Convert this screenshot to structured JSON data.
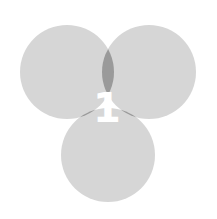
{
  "diagram": {
    "type": "venn",
    "circles": [
      {
        "name": "left",
        "cx": 67,
        "cy": 72,
        "r": 47
      },
      {
        "name": "right",
        "cx": 149,
        "cy": 72,
        "r": 47
      },
      {
        "name": "bottom",
        "cx": 108,
        "cy": 155,
        "r": 47
      }
    ],
    "center_label": "1",
    "colors": {
      "single": "#d6d6d6",
      "double": "#9a9a9a",
      "triple": "#050505",
      "label": "#ffffff",
      "background": "#ffffff"
    }
  }
}
